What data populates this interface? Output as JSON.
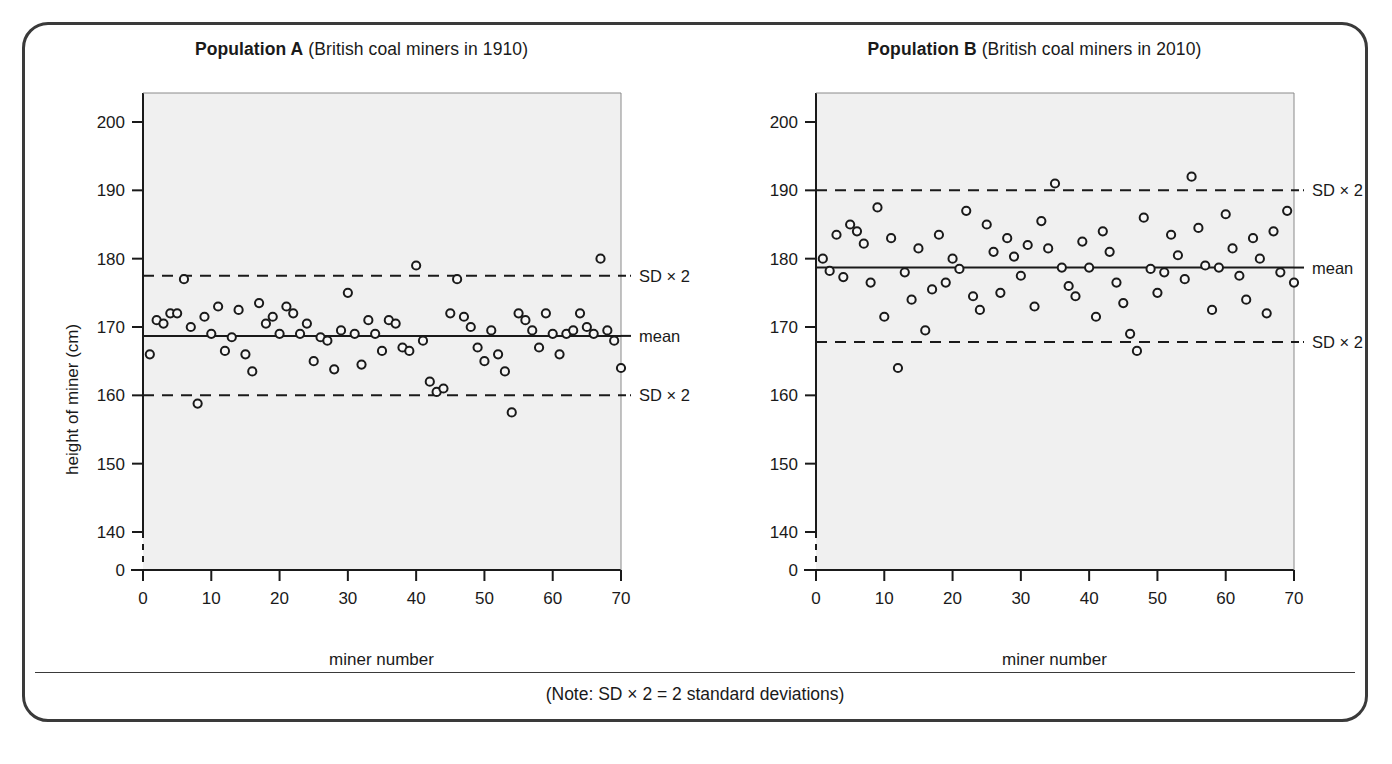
{
  "figure": {
    "note": "(Note: SD × 2 = 2 standard deviations)"
  },
  "panels": [
    {
      "id": "A",
      "title_bold": "Population A",
      "title_rest": " (British coal miners in 1910)",
      "xlabel": "miner number",
      "ylabel": "height of miner (cm)",
      "ann_upper": "SD × 2",
      "ann_mean": "mean",
      "ann_lower": "SD × 2"
    },
    {
      "id": "B",
      "title_bold": "Population B",
      "title_rest": " (British coal miners in 2010)",
      "xlabel": "miner number",
      "ylabel": "height of miner (cm)",
      "ann_upper": "SD × 2",
      "ann_mean": "mean",
      "ann_lower": "SD × 2"
    }
  ],
  "chart_data": [
    {
      "type": "scatter",
      "title": "Population A (British coal miners in 1910)",
      "xlabel": "miner number",
      "ylabel": "height of miner (cm)",
      "xlim": [
        0,
        70
      ],
      "xticks": [
        0,
        10,
        20,
        30,
        40,
        50,
        60,
        70
      ],
      "yticks": [
        0,
        140,
        150,
        160,
        170,
        180,
        190,
        200
      ],
      "y_axis_break_between": [
        0,
        140
      ],
      "grid": false,
      "marker": "open-circle",
      "reference_lines": [
        {
          "label": "SD × 2",
          "value": 177.5,
          "style": "dashed"
        },
        {
          "label": "mean",
          "value": 168.7,
          "style": "solid"
        },
        {
          "label": "SD × 2",
          "value": 160.0,
          "style": "dashed"
        }
      ],
      "x": [
        1,
        2,
        3,
        4,
        5,
        6,
        7,
        8,
        9,
        10,
        11,
        12,
        13,
        14,
        15,
        16,
        17,
        18,
        19,
        20,
        21,
        22,
        23,
        24,
        25,
        26,
        27,
        28,
        29,
        30,
        31,
        32,
        33,
        34,
        35,
        36,
        37,
        38,
        39,
        40,
        41,
        42,
        43,
        44,
        45,
        46,
        47,
        48,
        49,
        50,
        51,
        52,
        53,
        54,
        55,
        56,
        57,
        58,
        59,
        60,
        61,
        62,
        63,
        64,
        65,
        66,
        67,
        68,
        69,
        70
      ],
      "y": [
        166.0,
        171.0,
        170.5,
        172.0,
        172.0,
        177.0,
        170.0,
        158.8,
        171.5,
        169.0,
        173.0,
        166.5,
        168.5,
        172.5,
        166.0,
        163.5,
        173.5,
        170.5,
        171.5,
        169.0,
        173.0,
        172.0,
        169.0,
        170.5,
        165.0,
        168.5,
        168.0,
        163.8,
        169.5,
        175.0,
        169.0,
        164.5,
        171.0,
        169.0,
        166.5,
        171.0,
        170.5,
        167.0,
        166.5,
        179.0,
        168.0,
        162.0,
        160.5,
        161.0,
        172.0,
        177.0,
        171.5,
        170.0,
        167.0,
        165.0,
        169.5,
        166.0,
        163.5,
        157.5,
        172.0,
        171.0,
        169.5,
        167.0,
        172.0,
        169.0,
        166.0,
        169.0,
        169.5,
        172.0,
        170.0,
        169.0,
        180.0,
        169.5,
        168.0,
        164.0
      ]
    },
    {
      "type": "scatter",
      "title": "Population B (British coal miners in 2010)",
      "xlabel": "miner number",
      "ylabel": "height of miner (cm)",
      "xlim": [
        0,
        70
      ],
      "xticks": [
        0,
        10,
        20,
        30,
        40,
        50,
        60,
        70
      ],
      "yticks": [
        0,
        140,
        150,
        160,
        170,
        180,
        190,
        200
      ],
      "y_axis_break_between": [
        0,
        140
      ],
      "grid": false,
      "marker": "open-circle",
      "reference_lines": [
        {
          "label": "SD × 2",
          "value": 190.0,
          "style": "dashed"
        },
        {
          "label": "mean",
          "value": 178.7,
          "style": "solid"
        },
        {
          "label": "SD × 2",
          "value": 167.8,
          "style": "dashed"
        }
      ],
      "x": [
        1,
        2,
        3,
        4,
        5,
        6,
        7,
        8,
        9,
        10,
        11,
        12,
        13,
        14,
        15,
        16,
        17,
        18,
        19,
        20,
        21,
        22,
        23,
        24,
        25,
        26,
        27,
        28,
        29,
        30,
        31,
        32,
        33,
        34,
        35,
        36,
        37,
        38,
        39,
        40,
        41,
        42,
        43,
        44,
        45,
        46,
        47,
        48,
        49,
        50,
        51,
        52,
        53,
        54,
        55,
        56,
        57,
        58,
        59,
        60,
        61,
        62,
        63,
        64,
        65,
        66,
        67,
        68,
        69,
        70
      ],
      "y": [
        180.0,
        178.2,
        183.5,
        177.3,
        185.0,
        184.0,
        182.2,
        176.5,
        187.5,
        171.5,
        183.0,
        164.0,
        178.0,
        174.0,
        181.5,
        169.5,
        175.5,
        183.5,
        176.5,
        180.0,
        178.5,
        187.0,
        174.5,
        172.5,
        185.0,
        181.0,
        175.0,
        183.0,
        180.3,
        177.5,
        182.0,
        173.0,
        185.5,
        181.5,
        191.0,
        178.7,
        176.0,
        174.5,
        182.5,
        178.7,
        171.5,
        184.0,
        181.0,
        176.5,
        173.5,
        169.0,
        166.5,
        186.0,
        178.5,
        175.0,
        178.0,
        183.5,
        180.5,
        177.0,
        192.0,
        184.5,
        179.0,
        172.5,
        178.7,
        186.5,
        181.5,
        177.5,
        174.0,
        183.0,
        180.0,
        172.0,
        184.0,
        178.0,
        187.0,
        176.5
      ]
    }
  ]
}
